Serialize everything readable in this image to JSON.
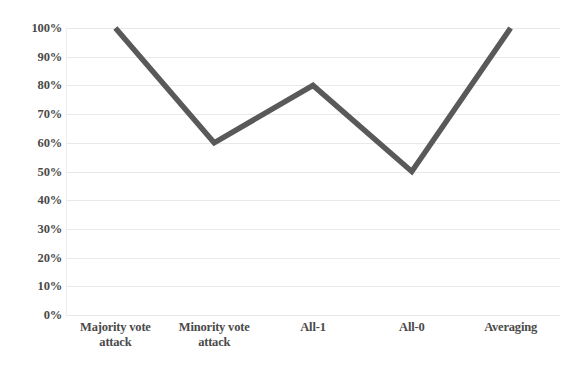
{
  "chart_data": {
    "type": "line",
    "title": "",
    "subtitle": "",
    "xlabel": "",
    "ylabel": "",
    "categories": [
      "Majority vote attack",
      "Minority vote attack",
      "All-1",
      "All-0",
      "Averaging"
    ],
    "values": [
      100,
      60,
      80,
      50,
      100
    ],
    "ylim": [
      0,
      100
    ],
    "y_ticks": [
      "0%",
      "10%",
      "20%",
      "30%",
      "40%",
      "50%",
      "60%",
      "70%",
      "80%",
      "90%",
      "100%"
    ],
    "y_tick_values": [
      0,
      10,
      20,
      30,
      40,
      50,
      60,
      70,
      80,
      90,
      100
    ],
    "grid": true,
    "legend": false,
    "legend_position": "none",
    "series": [
      {
        "name": "",
        "values": [
          100,
          60,
          80,
          50,
          100
        ],
        "color": "#595959"
      }
    ],
    "colors": {
      "line": "#595959",
      "gridline": "#e9e9e9",
      "axis": "#ededed",
      "tick_text": "#4a4a4a",
      "background": "#ffffff"
    },
    "annotations": []
  }
}
